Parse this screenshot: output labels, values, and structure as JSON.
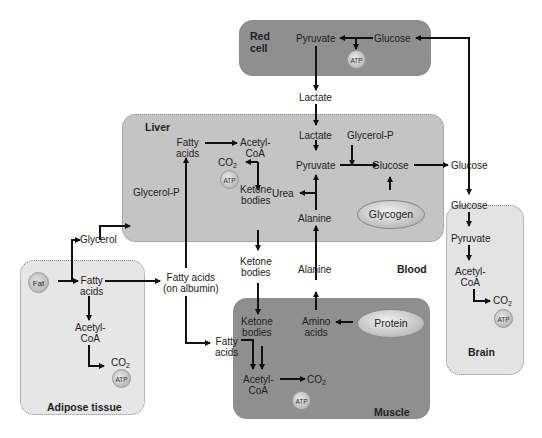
{
  "compartments": {
    "red_cell": {
      "title_line1": "Red",
      "title_line2": "cell",
      "pyruvate": "Pyruvate",
      "glucose": "Glucose",
      "atp": "ATP"
    },
    "liver": {
      "title": "Liver",
      "fatty_acids_1": "Fatty",
      "fatty_acids_2": "acids",
      "acetyl_1": "Acetyl-",
      "acetyl_2": "CoA",
      "co2": "CO",
      "co2_sub": "2",
      "atp": "ATP",
      "ketone_1": "Ketone",
      "ketone_2": "bodies",
      "glycerol_p": "Glycerol-P",
      "lactate": "Lactate",
      "glycerol_p2": "Glycerol-P",
      "pyruvate": "Pyruvate",
      "glucose": "Glucose",
      "urea": "Urea",
      "alanine": "Alanine",
      "glycogen": "Glycogen"
    },
    "blood": {
      "title": "Blood",
      "lactate": "Lactate",
      "glucose": "Glucose",
      "glycerol": "Glycerol",
      "fatty_albumin_1": "Fatty acids",
      "fatty_albumin_2": "(on albumin)",
      "ketone_1": "Ketone",
      "ketone_2": "bodies",
      "alanine": "Alanine"
    },
    "adipose": {
      "title": "Adipose tissue",
      "fat": "Fat",
      "fatty_1": "Fatty",
      "fatty_2": "acids",
      "acetyl_1": "Acetyl-",
      "acetyl_2": "CoA",
      "co2": "CO",
      "co2_sub": "2",
      "atp": "ATP"
    },
    "muscle": {
      "title": "Muscle",
      "ketone_1": "Ketone",
      "ketone_2": "bodies",
      "amino_1": "Amino",
      "amino_2": "acids",
      "protein": "Protein",
      "fatty_1": "Fatty",
      "fatty_2": "acids",
      "acetyl_1": "Acetyl-",
      "acetyl_2": "CoA",
      "co2": "CO",
      "co2_sub": "2",
      "atp": "ATP"
    },
    "brain": {
      "title": "Brain",
      "glucose": "Glucose",
      "pyruvate": "Pyruvate",
      "acetyl_1": "Acetyl-",
      "acetyl_2": "CoA",
      "co2": "CO",
      "co2_sub": "2",
      "atp": "ATP"
    }
  },
  "colors": {
    "dark_box": "#8f8f8f",
    "liver": "#c4c4c4",
    "light_box": "#e5e5e5",
    "arrow": "#111111"
  }
}
